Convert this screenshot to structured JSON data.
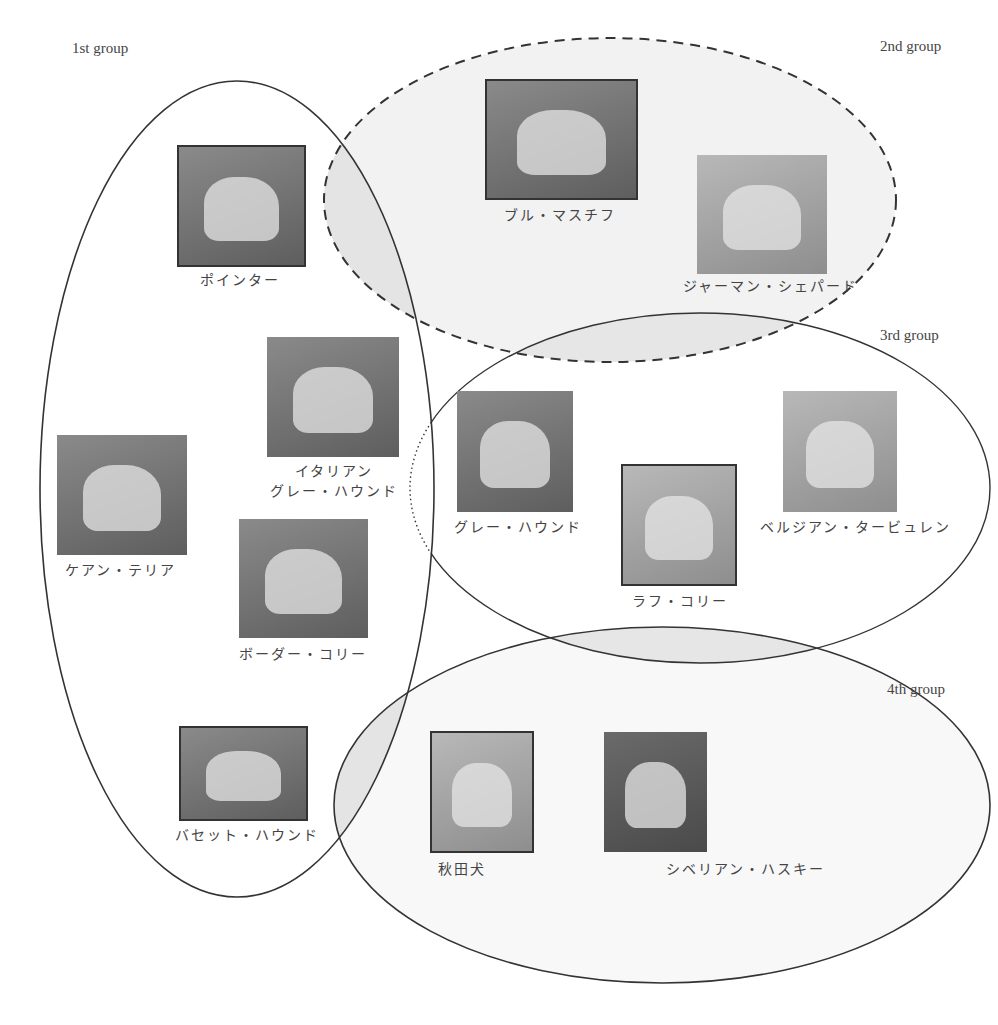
{
  "groups": [
    {
      "id": 1,
      "label": "1st group",
      "stroke": "solid",
      "fill": "#ffffff"
    },
    {
      "id": 2,
      "label": "2nd group",
      "stroke": "dashed",
      "fill": "#f2f2f2"
    },
    {
      "id": 3,
      "label": "3rd group",
      "stroke": "solid",
      "fill": "#ffffff"
    },
    {
      "id": 4,
      "label": "4th group",
      "stroke": "solid",
      "fill": "#f7f7f7"
    }
  ],
  "dogs": [
    {
      "name": "ポインター",
      "group": "1st group"
    },
    {
      "name": "ブル・マスチフ",
      "group": "2nd group"
    },
    {
      "name": "ジャーマン・シェパード",
      "group": "2nd group"
    },
    {
      "name_line1": "イタリアン",
      "name_line2": "グレー・ハウンド",
      "group": "1st group"
    },
    {
      "name": "ケアン・テリア",
      "group": "1st group"
    },
    {
      "name": "ボーダー・コリー",
      "group": "1st group"
    },
    {
      "name": "グレー・ハウンド",
      "group": "3rd group"
    },
    {
      "name": "ラフ・コリー",
      "group": "3rd group"
    },
    {
      "name": "ベルジアン・タービュレン",
      "group": "3rd group"
    },
    {
      "name": "バセット・ハウンド",
      "group": "1st group"
    },
    {
      "name": "秋田犬",
      "group": "4th group"
    },
    {
      "name": "シベリアン・ハスキー",
      "group": "4th group"
    }
  ],
  "colors": {
    "line": "#333333",
    "overlap_fill": "#e6e6e6"
  }
}
